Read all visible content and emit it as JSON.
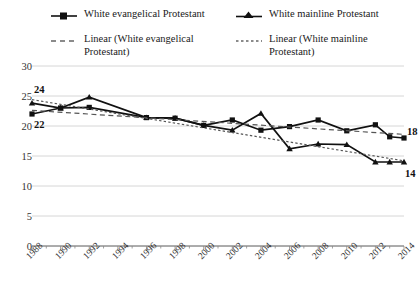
{
  "legend": {
    "items": [
      {
        "id": "evangelical",
        "label": "White evangelical Protestant",
        "marker": "square-line-marker",
        "style": "solid"
      },
      {
        "id": "mainline",
        "label": "White mainline Protestant",
        "marker": "triangle-line-marker",
        "style": "solid"
      },
      {
        "id": "trend_evangelical",
        "label": "Linear (White evangelical\nProtestant)",
        "marker": "dashed-line-marker",
        "style": "dashed"
      },
      {
        "id": "trend_mainline",
        "label": "Linear (White mainline\nProtestant)",
        "marker": "dotted-line-marker",
        "style": "dotted"
      }
    ]
  },
  "axis": {
    "y_ticks": [
      "0",
      "5",
      "10",
      "15",
      "20",
      "25",
      "30"
    ],
    "x_ticks": [
      "1988",
      "1990",
      "1992",
      "1994",
      "1996",
      "1998",
      "2000",
      "2002",
      "2004",
      "2006",
      "2008",
      "2010",
      "2012",
      "2014"
    ]
  },
  "annotations": [
    {
      "id": "start-mainline",
      "text": "24"
    },
    {
      "id": "start-evangelical",
      "text": "22"
    },
    {
      "id": "end-evangelical",
      "text": "18"
    },
    {
      "id": "end-mainline",
      "text": "14"
    }
  ],
  "colors": {
    "series": "#111111",
    "trend": "#555555",
    "grid": "#cccccc",
    "axis": "#888888",
    "background": "#ffffff"
  },
  "chart_data": {
    "type": "line",
    "title": "",
    "xlabel": "",
    "ylabel": "",
    "ylim": [
      0,
      30
    ],
    "xlim": [
      1988,
      2014
    ],
    "grid": true,
    "legend_position": "top",
    "x": [
      1988,
      1989,
      1990,
      1991,
      1992,
      1993,
      1994,
      1995,
      1996,
      1997,
      1998,
      1999,
      2000,
      2001,
      2002,
      2003,
      2004,
      2005,
      2006,
      2007,
      2008,
      2009,
      2010,
      2011,
      2012,
      2013,
      2014
    ],
    "categories": [
      1988,
      1990,
      1992,
      1994,
      1996,
      1998,
      2000,
      2002,
      2004,
      2006,
      2008,
      2010,
      2012,
      2014
    ],
    "series": [
      {
        "name": "White evangelical Protestant",
        "marker": "square",
        "line": "solid",
        "x": [
          1988,
          1990,
          1992,
          1996,
          1998,
          2000,
          2002,
          2004,
          2006,
          2008,
          2010,
          2012,
          2013,
          2014
        ],
        "values": [
          22.0,
          23.0,
          23.1,
          21.4,
          21.3,
          20.1,
          21.0,
          19.3,
          19.9,
          21.0,
          19.2,
          20.2,
          18.2,
          18.0
        ]
      },
      {
        "name": "White mainline Protestant",
        "marker": "triangle",
        "line": "solid",
        "x": [
          1988,
          1990,
          1992,
          1996,
          1998,
          2000,
          2002,
          2004,
          2006,
          2008,
          2010,
          2012,
          2013,
          2014
        ],
        "values": [
          23.8,
          23.0,
          24.8,
          21.4,
          21.3,
          20.1,
          19.3,
          22.1,
          16.2,
          17.0,
          16.9,
          14.0,
          14.0,
          14.0
        ]
      },
      {
        "name": "Linear (White evangelical Protestant)",
        "marker": "none",
        "line": "dashed",
        "x": [
          1988,
          2014
        ],
        "values": [
          22.6,
          18.6
        ]
      },
      {
        "name": "Linear (White mainline Protestant)",
        "marker": "none",
        "line": "dotted",
        "x": [
          1988,
          2014
        ],
        "values": [
          24.4,
          14.2
        ]
      }
    ]
  }
}
